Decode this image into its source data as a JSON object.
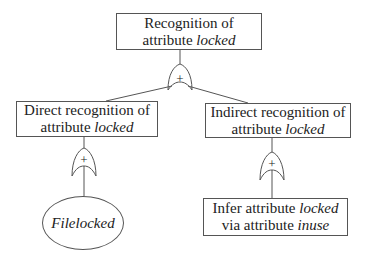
{
  "diagram": {
    "type": "goal-refinement tree",
    "gate_symbol": "+",
    "nodes": {
      "root": {
        "line1": "Recognition of",
        "line2_prefix": "attribute ",
        "line2_italic": "locked"
      },
      "left": {
        "line1": "Direct recognition of",
        "line2_prefix": "attribute ",
        "line2_italic": "locked"
      },
      "right": {
        "line1": "Indirect recognition of",
        "line2_prefix": "attribute ",
        "line2_italic": "locked"
      },
      "leaf_left": {
        "label_italic": "Filelocked"
      },
      "leaf_right": {
        "line1_prefix": "Infer attribute ",
        "line1_italic": "locked",
        "line2_prefix": "via attribute ",
        "line2_italic": "inuse"
      }
    },
    "edges": [
      {
        "from": "root",
        "to": "left",
        "gate": "+"
      },
      {
        "from": "root",
        "to": "right",
        "gate": "+"
      },
      {
        "from": "left",
        "to": "leaf_left",
        "gate": "+"
      },
      {
        "from": "right",
        "to": "leaf_right",
        "gate": "+"
      }
    ]
  }
}
